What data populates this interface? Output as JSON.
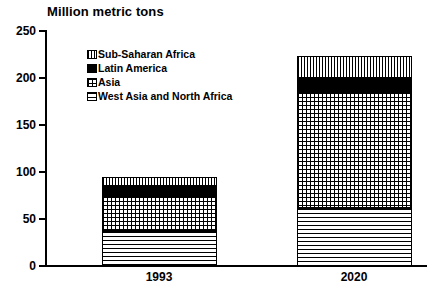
{
  "chart_data": {
    "type": "bar",
    "title": "Million metric tons",
    "subtitle": "",
    "xlabel": "",
    "ylabel": "Million metric tons",
    "stacked": true,
    "orientation": "vertical",
    "grid": false,
    "legend_position": "inside-top-left",
    "categories": [
      "1993",
      "2020"
    ],
    "ylim": [
      0,
      250
    ],
    "yticks": [
      0,
      50,
      100,
      150,
      200,
      250
    ],
    "ytick_labels": [
      "0",
      "50",
      "100",
      "150",
      "200",
      "250"
    ],
    "series": [
      {
        "name": "West Asia and North Africa",
        "pattern": "horizontal-lines",
        "values": [
          37,
          61
        ]
      },
      {
        "name": "Asia",
        "pattern": "checker",
        "values": [
          37,
          123
        ]
      },
      {
        "name": "Latin America",
        "pattern": "solid-black",
        "values": [
          11,
          15
        ]
      },
      {
        "name": "Sub-Saharan Africa",
        "pattern": "vertical-lines",
        "values": [
          9,
          24
        ]
      }
    ],
    "totals": [
      94,
      223
    ],
    "legend_order": [
      "Sub-Saharan Africa",
      "Latin America",
      "Asia",
      "West Asia and North Africa"
    ],
    "colors": {
      "foreground": "#000000",
      "background": "#ffffff"
    }
  },
  "legend": {
    "items": [
      {
        "label": "Sub-Saharan Africa"
      },
      {
        "label": "Latin America"
      },
      {
        "label": "Asia"
      },
      {
        "label": "West Asia and North Africa"
      }
    ]
  },
  "axis": {
    "y_labels": [
      "250",
      "200",
      "150",
      "100",
      "50",
      "0"
    ],
    "x_labels": [
      "1993",
      "2020"
    ]
  }
}
